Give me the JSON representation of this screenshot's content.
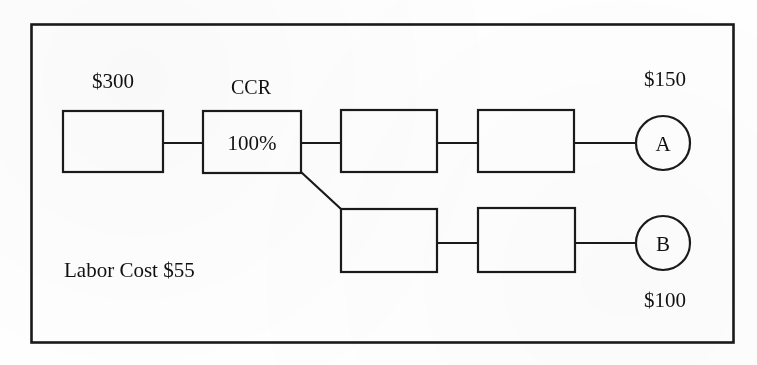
{
  "diagram": {
    "type": "process-flow",
    "title": "",
    "frame": {
      "visible": true,
      "color": "#1a1a1a"
    },
    "line_color": "#1a1a1a",
    "background_color": "#ffffff",
    "annotations": {
      "raw_material_value": "$300",
      "ccr_title": "CCR",
      "ccr_utilization": "100%",
      "branch_a_value": "$150",
      "branch_b_value": "$100",
      "labor_cost": "Labor Cost  $55"
    },
    "nodes": [
      {
        "id": "op1",
        "shape": "rectangle",
        "label": "",
        "row": "top"
      },
      {
        "id": "ccr",
        "shape": "rectangle",
        "label": "100%",
        "row": "top"
      },
      {
        "id": "op3",
        "shape": "rectangle",
        "label": "",
        "row": "top"
      },
      {
        "id": "op4",
        "shape": "rectangle",
        "label": "",
        "row": "top"
      },
      {
        "id": "op5",
        "shape": "rectangle",
        "label": "",
        "row": "bottom"
      },
      {
        "id": "op6",
        "shape": "rectangle",
        "label": "",
        "row": "bottom"
      },
      {
        "id": "productA",
        "shape": "circle",
        "label": "A",
        "row": "top"
      },
      {
        "id": "productB",
        "shape": "circle",
        "label": "B",
        "row": "bottom"
      }
    ],
    "edges": [
      {
        "from": "op1",
        "to": "ccr",
        "style": "straight"
      },
      {
        "from": "ccr",
        "to": "op3",
        "style": "straight"
      },
      {
        "from": "op3",
        "to": "op4",
        "style": "straight"
      },
      {
        "from": "op4",
        "to": "productA",
        "style": "straight"
      },
      {
        "from": "ccr",
        "to": "op5",
        "style": "diagonal"
      },
      {
        "from": "op5",
        "to": "op6",
        "style": "straight"
      },
      {
        "from": "op6",
        "to": "productB",
        "style": "straight"
      }
    ]
  }
}
